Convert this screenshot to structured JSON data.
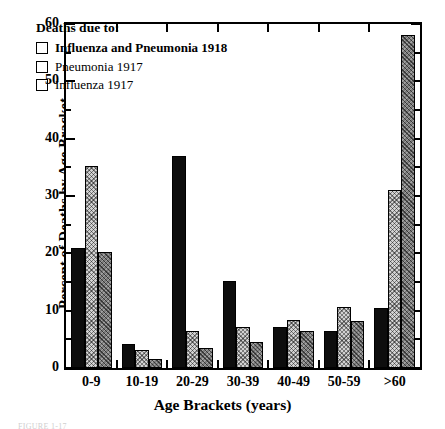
{
  "chart_data": {
    "type": "bar",
    "title": "",
    "xlabel": "Age Brackets (years)",
    "ylabel": "Percent of Deaths by Age Bracket",
    "categories": [
      "0-9",
      "10-19",
      "20-29",
      "30-39",
      "40-49",
      "50-59",
      ">60"
    ],
    "series": [
      {
        "name": "Influenza and Pneumonia 1918",
        "values": [
          21,
          4.2,
          37,
          15.2,
          7.2,
          6.5,
          10.5
        ]
      },
      {
        "name": "Pneumonia  1917",
        "values": [
          35.3,
          3.2,
          6.5,
          7.2,
          8.3,
          10.6,
          31
        ]
      },
      {
        "name": "Influenza  1917",
        "values": [
          20.2,
          1.6,
          3.5,
          4.5,
          6.5,
          8.2,
          58
        ]
      }
    ],
    "ylim": [
      0,
      60
    ],
    "ytick_labels": [
      "0",
      "10",
      "20",
      "30",
      "40",
      "50",
      "60"
    ],
    "ytick_values": [
      0,
      10,
      20,
      30,
      40,
      50,
      60
    ],
    "yminor_values": [
      5,
      15,
      25,
      35,
      45,
      55
    ],
    "grid": false,
    "legend_position": "upper-left-inside"
  },
  "legend": {
    "title": "Deaths due to:",
    "entries": [
      {
        "label": "Influenza and Pneumonia 1918",
        "style": "solid-black",
        "color": "#0d0d0d"
      },
      {
        "label": "Pneumonia  1917",
        "style": "light-hatch",
        "color": "#d2d2d2"
      },
      {
        "label": "Influenza  1917",
        "style": "dark-hatch",
        "color": "#7a7a7a"
      }
    ]
  },
  "caption": {
    "text": "FIGURE 1-17"
  }
}
